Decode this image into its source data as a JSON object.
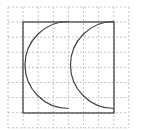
{
  "diagram": {
    "grid": {
      "x0": 8,
      "y0": 7,
      "cell": 15.1,
      "cols": 8,
      "rows": 8,
      "color": "#b8b8b8"
    },
    "square": {
      "x": 23,
      "y": 22,
      "size": 91,
      "color": "#444444"
    },
    "arcs": [
      {
        "cx": 68.5,
        "cy": 65,
        "r": 43.5
      },
      {
        "cx": 114,
        "cy": 65,
        "r": 43.5
      }
    ],
    "stroke_color": "#444444"
  }
}
